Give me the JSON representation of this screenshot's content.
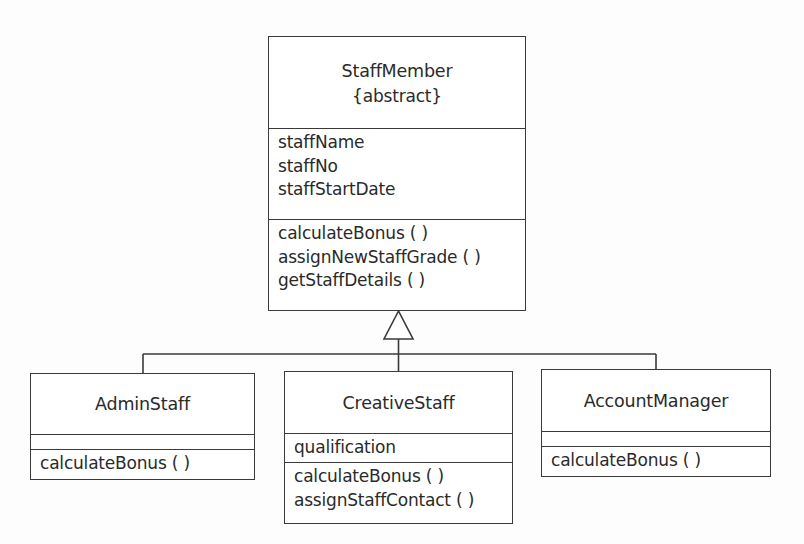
{
  "diagram": {
    "type": "UML class diagram (generalization / inheritance)",
    "line_color": "#3a3a3a",
    "background": "#ffffff"
  },
  "classes": {
    "staff_member": {
      "name": "StaffMember",
      "stereotype": "{abstract}",
      "attributes": [
        "staffName",
        "staffNo",
        "staffStartDate"
      ],
      "operations": [
        "calculateBonus ( )",
        "assignNewStaffGrade ( )",
        "getStaffDetails ( )"
      ]
    },
    "admin_staff": {
      "name": "AdminStaff",
      "attributes": [],
      "operations": [
        "calculateBonus ( )"
      ]
    },
    "creative_staff": {
      "name": "CreativeStaff",
      "attributes": [
        "qualification"
      ],
      "operations": [
        "calculateBonus ( )",
        "assignStaffContact ( )"
      ]
    },
    "account_manager": {
      "name": "AccountManager",
      "attributes": [],
      "operations": [
        "calculateBonus ( )"
      ]
    }
  },
  "relationships": [
    {
      "type": "generalization",
      "from": "AdminStaff",
      "to": "StaffMember"
    },
    {
      "type": "generalization",
      "from": "CreativeStaff",
      "to": "StaffMember"
    },
    {
      "type": "generalization",
      "from": "AccountManager",
      "to": "StaffMember"
    }
  ]
}
